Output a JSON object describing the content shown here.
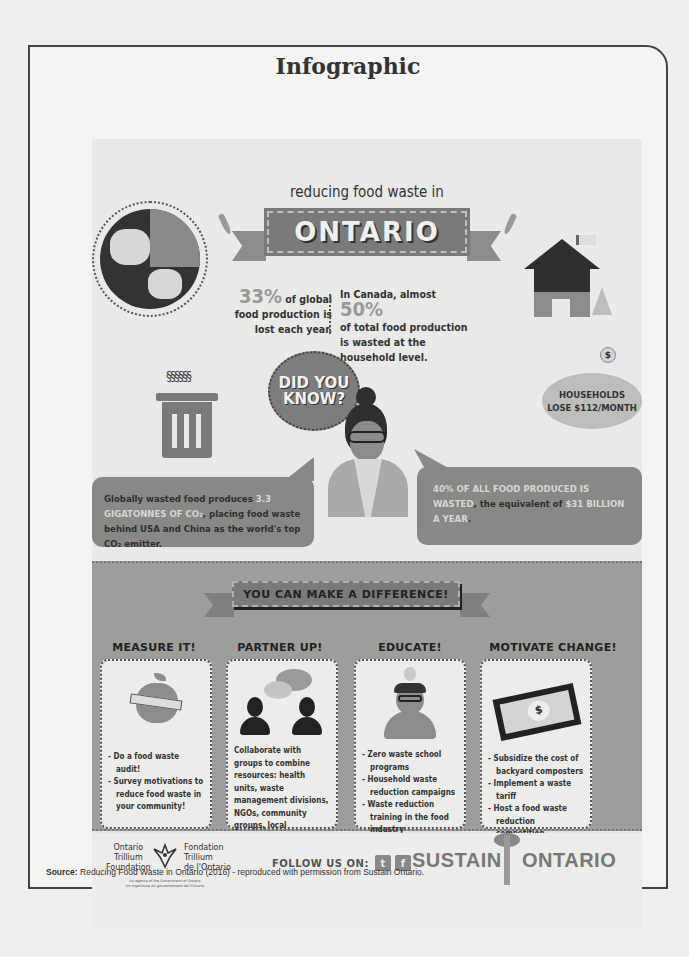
{
  "page": {
    "frame_title": "Infographic",
    "source_label": "Source:",
    "source_text": " Reducing Food Waste in Ontario (2016) - reproduced with permission from Sustain Ontario."
  },
  "background_page": {
    "headings": [
      "Evaluation of",
      "Alternatives",
      "Assessing Value"
    ]
  },
  "infographic": {
    "subtitle": "reducing food waste in",
    "banner": "ONTARIO",
    "stat_global": {
      "value": "33%",
      "text": " of global food production is lost each year."
    },
    "stat_canada": {
      "prefix": "In Canada, almost ",
      "value": "50%",
      "text": "of total food production is wasted at the household level."
    },
    "did_you_know": "DID YOU KNOW?",
    "piggy_bank": {
      "coin": "$",
      "line1": "HOUSEHOLDS",
      "line2": "LOSE $112/MONTH"
    },
    "bubble_left": {
      "pre": "Globally wasted food produces ",
      "highlight": "3.3 GIGATONNES OF CO₂",
      "post": ", placing food waste behind USA and China as the world's top CO₂ emitter."
    },
    "bubble_right": {
      "highlight1": "40% OF ALL FOOD PRODUCED IS WASTED",
      "mid": ", the equivalent of ",
      "highlight2": "$31 BILLION A YEAR",
      "post": "."
    },
    "difference_banner": "YOU CAN MAKE A DIFFERENCE!",
    "columns": [
      {
        "title": "MEASURE IT!",
        "icon": "apple-measuring-tape-icon",
        "bullets": [
          "- Do a food waste audit!",
          "- Survey motivations to reduce food waste in your community!"
        ]
      },
      {
        "title": "PARTNER UP!",
        "icon": "people-chat-icon",
        "bullets": [
          "Collaborate with groups to combine resources: health units, waste management divisions, NGOs, community groups, local institutions and researchers."
        ]
      },
      {
        "title": "EDUCATE!",
        "icon": "teacher-lightbulb-icon",
        "bullets": [
          "- Zero waste school programs",
          "- Household waste reduction campaigns",
          "- Waste reduction training in the food industry"
        ]
      },
      {
        "title": "MOTIVATE CHANGE!",
        "icon": "dollar-bill-icon",
        "bullets": [
          "- Subsidize the cost of backyard composters",
          "- Implement a waste tariff",
          "- Host a food waste reduction competition"
        ]
      }
    ],
    "footer": {
      "otf_en": "Ontario\nTrillium\nFoundation",
      "otf_fr": "Fondation\nTrillium\nde l'Ontario",
      "otf_small": "An agency of the Government of Ontario\nUn organisme du gouvernement de l'Ontario",
      "follow_label": "FOLLOW US ON:",
      "social": [
        {
          "name": "twitter",
          "glyph": "t"
        },
        {
          "name": "facebook",
          "glyph": "f"
        }
      ],
      "brand_left": "SUSTAIN",
      "brand_right": "ONTARIO"
    }
  },
  "colors": {
    "dark": "#2f2f2f",
    "mid_gray": "#888886",
    "light_gray": "#e9e9e7",
    "highlight": "#d6d6d4"
  }
}
